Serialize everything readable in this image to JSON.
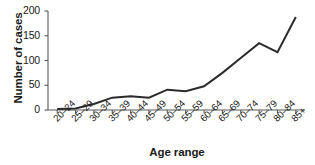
{
  "chart_data": {
    "type": "line",
    "title": "",
    "xlabel": "Age range",
    "ylabel": "Number of cases",
    "categories": [
      "20–24",
      "25–29",
      "30–34",
      "35–39",
      "40–44",
      "45–49",
      "50–54",
      "55–59",
      "60–64",
      "65–69",
      "70–74",
      "75–79",
      "80–84",
      "85+"
    ],
    "values": [
      2,
      3,
      12,
      25,
      28,
      25,
      41,
      38,
      48,
      75,
      105,
      135,
      117,
      188
    ],
    "series": [
      {
        "name": "Number of cases",
        "values": [
          2,
          3,
          12,
          25,
          28,
          25,
          41,
          38,
          48,
          75,
          105,
          135,
          117,
          188
        ]
      }
    ],
    "ylim": [
      0,
      200
    ],
    "yticks": [
      0,
      50,
      100,
      150,
      200
    ],
    "ytick_labels": [
      "0",
      "50",
      "100",
      "150",
      "200"
    ],
    "grid": false,
    "legend": false,
    "legend_position": "none",
    "line_color": "#2b2b2b",
    "background_color": "#ffffff",
    "axis_color": "#595959"
  }
}
